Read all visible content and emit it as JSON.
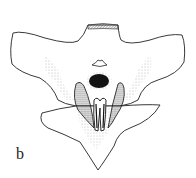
{
  "figure": {
    "panel_label": "b"
  }
}
